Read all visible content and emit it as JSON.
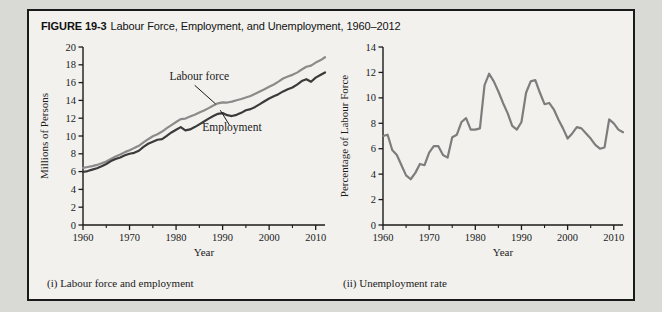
{
  "figure": {
    "number": "FIGURE 19-3",
    "title": "Labour Force, Employment, and Unemployment, 1960–2012",
    "border_color": "#1a1a1a",
    "background_color": "#f2f1ee",
    "page_background": "#d9d9d6"
  },
  "panels": {
    "left_caption": "(i) Labour force and employment",
    "right_caption": "(ii) Unemployment rate"
  },
  "chart_data": [
    {
      "type": "line",
      "id": "labour-force-employment",
      "title": "",
      "xlabel": "Year",
      "ylabel": "Millions of Persons",
      "xlim": [
        1960,
        2012
      ],
      "ylim": [
        0,
        20
      ],
      "yticks": [
        0,
        2,
        4,
        6,
        8,
        10,
        12,
        14,
        16,
        18,
        20
      ],
      "ytick_labels": [
        "0",
        "2",
        "4",
        "6",
        "8",
        "10",
        "12",
        "14",
        "16",
        "18",
        "20"
      ],
      "xticks": [
        1960,
        1970,
        1980,
        1990,
        2000,
        2010
      ],
      "xtick_labels": [
        "1960",
        "1970",
        "1980",
        "1990",
        "2000",
        "2010"
      ],
      "xminor_ticks": [
        1965,
        1975,
        1985,
        1995,
        2005
      ],
      "grid": false,
      "legend": "annotated-inline",
      "annotations": [
        {
          "text": "Labour force",
          "x": 1985,
          "y": 16.3
        },
        {
          "text": "Employment",
          "x": 1992,
          "y": 10.6
        }
      ],
      "x": [
        1960,
        1961,
        1962,
        1963,
        1964,
        1965,
        1966,
        1967,
        1968,
        1969,
        1970,
        1971,
        1972,
        1973,
        1974,
        1975,
        1976,
        1977,
        1978,
        1979,
        1980,
        1981,
        1982,
        1983,
        1984,
        1985,
        1986,
        1987,
        1988,
        1989,
        1990,
        1991,
        1992,
        1993,
        1994,
        1995,
        1996,
        1997,
        1998,
        1999,
        2000,
        2001,
        2002,
        2003,
        2004,
        2005,
        2006,
        2007,
        2008,
        2009,
        2010,
        2011,
        2012
      ],
      "series": [
        {
          "name": "Labour force",
          "color": "#8b8b8b",
          "values": [
            6.41,
            6.52,
            6.62,
            6.75,
            6.93,
            7.14,
            7.42,
            7.69,
            7.92,
            8.19,
            8.4,
            8.64,
            8.9,
            9.28,
            9.64,
            9.97,
            10.2,
            10.5,
            10.88,
            11.23,
            11.57,
            11.9,
            11.96,
            12.18,
            12.4,
            12.64,
            12.87,
            13.13,
            13.42,
            13.67,
            13.78,
            13.76,
            13.86,
            14.02,
            14.16,
            14.33,
            14.5,
            14.74,
            15.01,
            15.26,
            15.53,
            15.79,
            16.11,
            16.46,
            16.68,
            16.87,
            17.12,
            17.47,
            17.78,
            17.9,
            18.25,
            18.5,
            18.85
          ]
        },
        {
          "name": "Employment",
          "color": "#3a3a3a",
          "values": [
            5.96,
            6.06,
            6.22,
            6.38,
            6.61,
            6.86,
            7.18,
            7.42,
            7.59,
            7.83,
            8.01,
            8.11,
            8.34,
            8.78,
            9.13,
            9.36,
            9.58,
            9.65,
            10.02,
            10.4,
            10.71,
            11.0,
            10.64,
            10.74,
            11.0,
            11.31,
            11.63,
            11.95,
            12.25,
            12.49,
            12.57,
            12.34,
            12.24,
            12.38,
            12.6,
            12.89,
            13.02,
            13.27,
            13.58,
            13.91,
            14.22,
            14.46,
            14.7,
            15.01,
            15.25,
            15.45,
            15.77,
            16.17,
            16.38,
            16.09,
            16.56,
            16.85,
            17.14
          ]
        }
      ]
    },
    {
      "type": "line",
      "id": "unemployment-rate",
      "title": "",
      "xlabel": "Year",
      "ylabel": "Percentage of Labour Force",
      "xlim": [
        1960,
        2012
      ],
      "ylim": [
        0,
        14
      ],
      "yticks": [
        0,
        2,
        4,
        6,
        8,
        10,
        12,
        14
      ],
      "ytick_labels": [
        "0",
        "2",
        "4",
        "6",
        "8",
        "10",
        "12",
        "14"
      ],
      "xticks": [
        1960,
        1970,
        1980,
        1990,
        2000,
        2010
      ],
      "xtick_labels": [
        "1960",
        "1970",
        "1980",
        "1990",
        "2000",
        "2010"
      ],
      "xminor_ticks": [
        1965,
        1975,
        1985,
        1995,
        2005
      ],
      "grid": false,
      "legend": "none",
      "x": [
        1960,
        1961,
        1962,
        1963,
        1964,
        1965,
        1966,
        1967,
        1968,
        1969,
        1970,
        1971,
        1972,
        1973,
        1974,
        1975,
        1976,
        1977,
        1978,
        1979,
        1980,
        1981,
        1982,
        1983,
        1984,
        1985,
        1986,
        1987,
        1988,
        1989,
        1990,
        1991,
        1992,
        1993,
        1994,
        1995,
        1996,
        1997,
        1998,
        1999,
        2000,
        2001,
        2002,
        2003,
        2004,
        2005,
        2006,
        2007,
        2008,
        2009,
        2010,
        2011,
        2012
      ],
      "series": [
        {
          "name": "Unemployment rate",
          "color": "#7d7d7d",
          "values": [
            7.0,
            7.1,
            5.9,
            5.5,
            4.7,
            3.9,
            3.6,
            4.1,
            4.8,
            4.7,
            5.7,
            6.2,
            6.2,
            5.5,
            5.3,
            6.9,
            7.1,
            8.1,
            8.4,
            7.5,
            7.5,
            7.6,
            11.0,
            11.9,
            11.3,
            10.5,
            9.6,
            8.8,
            7.8,
            7.5,
            8.1,
            10.4,
            11.3,
            11.4,
            10.4,
            9.5,
            9.6,
            9.1,
            8.3,
            7.6,
            6.8,
            7.2,
            7.7,
            7.6,
            7.2,
            6.8,
            6.3,
            6.0,
            6.1,
            8.3,
            8.0,
            7.5,
            7.3
          ]
        }
      ]
    }
  ]
}
